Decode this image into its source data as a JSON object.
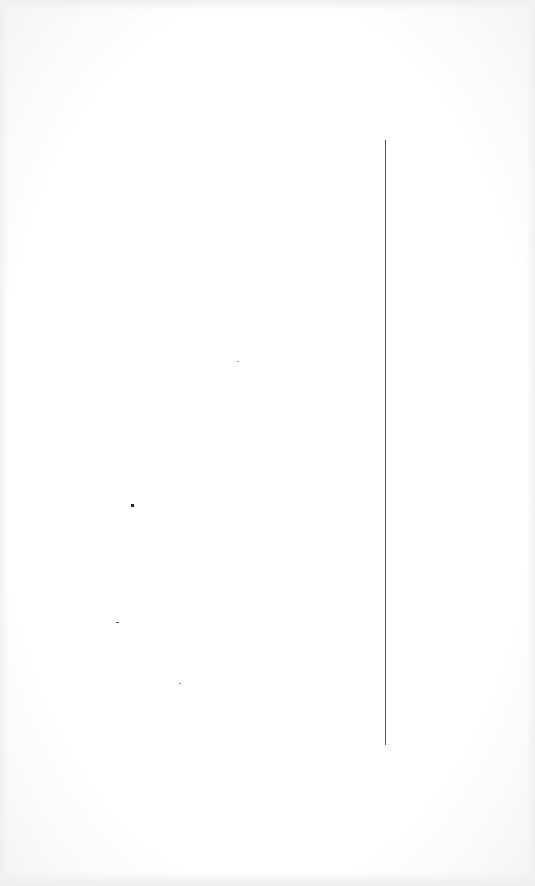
{
  "page": {
    "background": "#ffffff"
  },
  "line": {
    "orientation": "vertical",
    "x": 385,
    "y_start": 140,
    "y_end": 745,
    "color": "#555555"
  },
  "specks": [
    {
      "x": 131,
      "y": 504,
      "w": 3,
      "h": 3,
      "color": "#222222"
    },
    {
      "x": 237,
      "y": 361,
      "w": 2,
      "h": 1,
      "color": "#999999"
    },
    {
      "x": 116,
      "y": 622,
      "w": 3,
      "h": 1,
      "color": "#555555"
    },
    {
      "x": 179,
      "y": 683,
      "w": 2,
      "h": 1,
      "color": "#777777"
    }
  ]
}
